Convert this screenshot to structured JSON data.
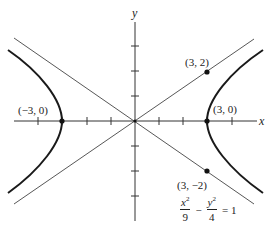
{
  "diagram": {
    "type": "hyperbola",
    "axes": {
      "x_label": "x",
      "y_label": "y",
      "x_ticks": [
        -4,
        -3,
        -2,
        -1,
        1,
        2,
        3,
        4
      ],
      "y_ticks": [
        -4,
        -3,
        -2,
        -1,
        1,
        2,
        3,
        4
      ]
    },
    "points": [
      {
        "id": "left-vertex",
        "label": "(−3, 0)",
        "x": -3,
        "y": 0
      },
      {
        "id": "right-vertex",
        "label": "(3, 0)",
        "x": 3,
        "y": 0
      },
      {
        "id": "asymptote-point-upper",
        "label": "(3, 2)",
        "x": 3,
        "y": 2
      },
      {
        "id": "asymptote-point-lower",
        "label": "(3, −2)",
        "x": 3,
        "y": -2
      }
    ],
    "asymptotes": [
      "y = (2/3)x",
      "y = −(2/3)x"
    ],
    "equation": {
      "term1_num": "x",
      "term1_exp": "2",
      "term1_den": "9",
      "minus": "−",
      "term2_num": "y",
      "term2_exp": "2",
      "term2_den": "4",
      "equals": "= 1"
    },
    "colors": {
      "curve": "#1a1a1a",
      "asymptote": "#444444",
      "axis": "#333333"
    }
  }
}
